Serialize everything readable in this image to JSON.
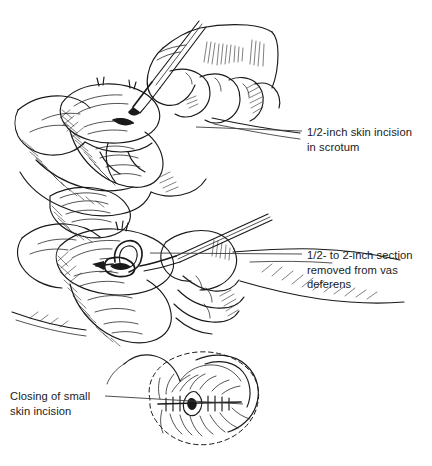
{
  "figure": {
    "background_color": "#ffffff",
    "ink_color": "#1a1a1a",
    "width": 432,
    "height": 466
  },
  "labels": {
    "incision": "1/2-inch skin incision\nin scrotum",
    "vas": "1/2- to 2-inch section\nremoved from vas\ndeferens",
    "closing": "Closing of small\nskin incision"
  },
  "panels": [
    {
      "id": "panel-1",
      "caption_ref": "incision",
      "description": "Gloved hands steadying the scrotum while a scalpel makes a small skin incision"
    },
    {
      "id": "panel-2",
      "caption_ref": "vas",
      "description": "A loop of vas deferens drawn out through the incision with a hook instrument"
    },
    {
      "id": "panel-3",
      "caption_ref": "closing",
      "description": "Dashed scrotal outline with the small incision closed by sutures and a curved needle"
    }
  ],
  "leaders": [
    {
      "id": "leader-incision",
      "from": [
        196,
        127
      ],
      "to": [
        302,
        131
      ]
    },
    {
      "id": "leader-vas",
      "from": [
        150,
        253
      ],
      "to": [
        302,
        254
      ]
    },
    {
      "id": "leader-closing",
      "from": [
        105,
        396
      ],
      "to": [
        243,
        404
      ]
    }
  ]
}
